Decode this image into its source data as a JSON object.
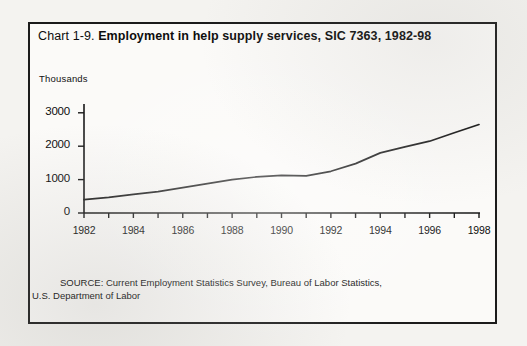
{
  "document": {
    "title_prefix": "Chart 1-9.",
    "title_main": "Employment in help supply services, SIC 7363, 1982-98",
    "source_line_1": "SOURCE: Current Employment Statistics Survey, Bureau of Labor Statistics,",
    "source_line_2": "U.S. Department of Labor"
  },
  "chart_data": {
    "type": "line",
    "title": "Chart 1-9. Employment in help supply services, SIC 7363, 1982-98",
    "xlabel": "",
    "ylabel": "Thousands",
    "ylim": [
      0,
      3500
    ],
    "xlim": [
      1982,
      1998
    ],
    "grid": false,
    "legend": false,
    "y_ticks": [
      "0",
      "1000",
      "2000",
      "3000"
    ],
    "y_tick_values": [
      0,
      1000,
      2000,
      3000
    ],
    "x_ticks": [
      "1982",
      "1984",
      "1986",
      "1988",
      "1990",
      "1992",
      "1994",
      "1996",
      "1998"
    ],
    "x_tick_values": [
      1982,
      1984,
      1986,
      1988,
      1990,
      1992,
      1994,
      1996,
      1998
    ],
    "x_minor_interval": 1,
    "line_color": "#1a1a1a",
    "x": [
      1982,
      1983,
      1984,
      1985,
      1986,
      1987,
      1988,
      1989,
      1990,
      1991,
      1992,
      1993,
      1994,
      1995,
      1996,
      1997,
      1998
    ],
    "values": [
      400,
      470,
      560,
      640,
      760,
      880,
      1000,
      1080,
      1130,
      1110,
      1250,
      1480,
      1800,
      1980,
      2150,
      2400,
      2650
    ],
    "series": [
      {
        "name": "Help supply services employment",
        "values": [
          400,
          470,
          560,
          640,
          760,
          880,
          1000,
          1080,
          1130,
          1110,
          1250,
          1480,
          1800,
          1980,
          2150,
          2400,
          2650
        ]
      }
    ]
  }
}
